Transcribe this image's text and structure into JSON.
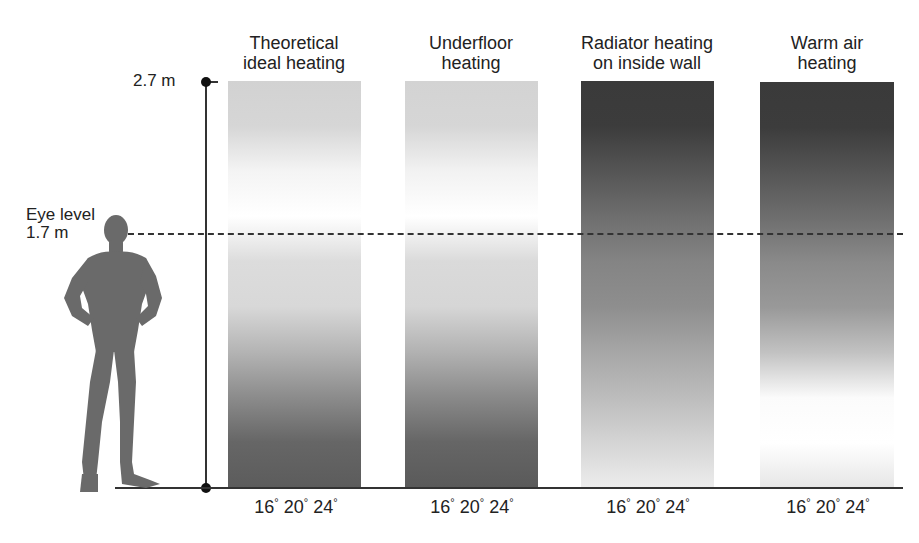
{
  "title": {
    "text": "Heating",
    "partially_visible": true
  },
  "axis": {
    "top_label": "2.7 m",
    "eye_level_label_line1": "Eye level",
    "eye_level_label_line2": "1.7 m"
  },
  "columns": [
    {
      "label_line1": "Theoretical",
      "label_line2": "ideal heating",
      "gradient_top_to_bottom": [
        "#d2d2d2",
        "#d6d6d6",
        "#f4f4f4",
        "#ffffff",
        "#dcdcdc",
        "#d8d8d8",
        "#b4b4b4",
        "#8c8c8c",
        "#666666",
        "#5c5c5c"
      ],
      "scale": {
        "t1": "16",
        "t2": "20",
        "t3": "24",
        "unit": "°"
      }
    },
    {
      "label_line1": "Underfloor",
      "label_line2": "heating",
      "gradient_top_to_bottom": [
        "#d3d3d3",
        "#d6d6d6",
        "#f2f2f2",
        "#ffffff",
        "#dadada",
        "#d6d6d6",
        "#b2b2b2",
        "#8a8a8a",
        "#666666",
        "#5a5a5a"
      ],
      "scale": {
        "t1": "16",
        "t2": "20",
        "t3": "24",
        "unit": "°"
      }
    },
    {
      "label_line1": "Radiator heating",
      "label_line2": "on inside wall",
      "gradient_top_to_bottom": [
        "#3a3a3a",
        "#3c3c3c",
        "#555555",
        "#6e6e6e",
        "#848484",
        "#8e8e8e",
        "#a6a6a6",
        "#bcbcbc",
        "#d4d4d4",
        "#ececec"
      ],
      "scale": {
        "t1": "16",
        "t2": "20",
        "t3": "24",
        "unit": "°"
      }
    },
    {
      "label_line1": "Warm air",
      "label_line2": "heating",
      "gradient_top_to_bottom": [
        "#3a3a3a",
        "#3c3c3c",
        "#555555",
        "#6e6e6e",
        "#8a8a8a",
        "#999999",
        "#c2c2c2",
        "#fbfbfb",
        "#ffffff",
        "#e6e6e6"
      ],
      "scale": {
        "t1": "16",
        "t2": "20",
        "t3": "24",
        "unit": "°"
      }
    }
  ],
  "colors": {
    "axis": "#333333",
    "figure": "#6a6a6a",
    "text": "#222222"
  }
}
